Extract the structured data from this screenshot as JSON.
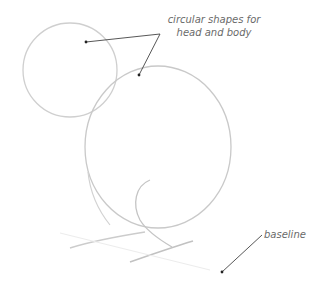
{
  "diagram": {
    "title": "",
    "annotations": [
      {
        "id": "head-body",
        "lines": [
          "circular shapes for",
          "head and body"
        ]
      },
      {
        "id": "baseline",
        "lines": [
          "baseline"
        ]
      }
    ],
    "shapes": [
      {
        "name": "head-circle",
        "type": "circle",
        "cx": 70,
        "cy": 70,
        "r": 47
      },
      {
        "name": "body-circle",
        "type": "ellipse",
        "cx": 158,
        "cy": 147,
        "rx": 74,
        "ry": 81
      },
      {
        "name": "haunch-curve",
        "type": "curve"
      },
      {
        "name": "front-leg-curve",
        "type": "curve"
      },
      {
        "name": "baseline-strokes",
        "type": "lines"
      }
    ],
    "colors": {
      "sketch": "#c8c8c8",
      "leader": "#333333",
      "text": "#6a6a6a"
    }
  }
}
